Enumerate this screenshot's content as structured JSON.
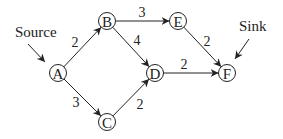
{
  "diagram": {
    "type": "directed-network-flow",
    "nodes": [
      {
        "id": "A",
        "label": "A",
        "x": 58,
        "y": 73
      },
      {
        "id": "B",
        "label": "B",
        "x": 107,
        "y": 21
      },
      {
        "id": "C",
        "label": "C",
        "x": 107,
        "y": 122
      },
      {
        "id": "D",
        "label": "D",
        "x": 155,
        "y": 73
      },
      {
        "id": "E",
        "label": "E",
        "x": 178,
        "y": 21
      },
      {
        "id": "F",
        "label": "F",
        "x": 227,
        "y": 73
      }
    ],
    "edges": [
      {
        "from": "A",
        "to": "B",
        "weight": "2",
        "lx": 75,
        "ly": 42
      },
      {
        "from": "A",
        "to": "C",
        "weight": "3",
        "lx": 76,
        "ly": 102
      },
      {
        "from": "B",
        "to": "E",
        "weight": "3",
        "lx": 142,
        "ly": 12
      },
      {
        "from": "B",
        "to": "D",
        "weight": "4",
        "lx": 137,
        "ly": 40
      },
      {
        "from": "C",
        "to": "D",
        "weight": "2",
        "lx": 140,
        "ly": 104
      },
      {
        "from": "E",
        "to": "F",
        "weight": "2",
        "lx": 207,
        "ly": 41
      },
      {
        "from": "D",
        "to": "F",
        "weight": "2",
        "lx": 184,
        "ly": 64
      }
    ],
    "annotations": [
      {
        "id": "source",
        "text": "Source",
        "x": 15,
        "y": 37
      },
      {
        "id": "sink",
        "text": "Sink",
        "x": 239,
        "y": 31
      }
    ]
  }
}
